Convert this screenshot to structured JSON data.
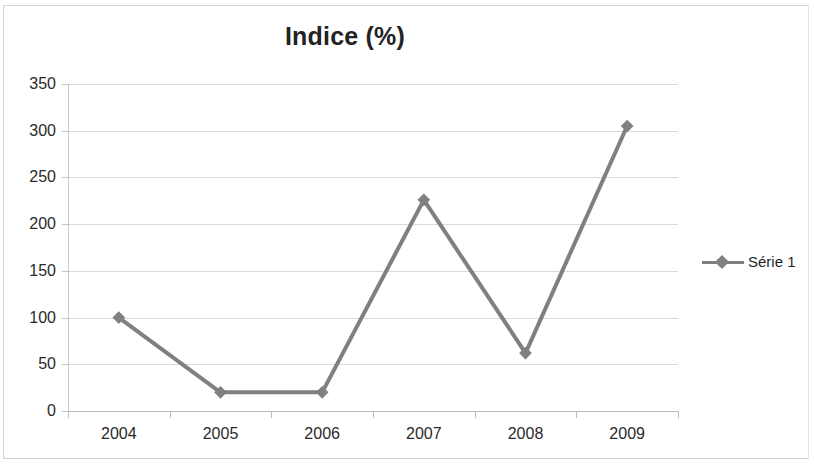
{
  "chart_data": {
    "type": "line",
    "title": "Indice (%)",
    "xlabel": "",
    "ylabel": "",
    "categories": [
      "2004",
      "2005",
      "2006",
      "2007",
      "2008",
      "2009"
    ],
    "series": [
      {
        "name": "Série 1",
        "values": [
          100,
          20,
          20,
          226,
          62,
          305
        ],
        "color": "#808080",
        "marker": "diamond"
      }
    ],
    "ylim": [
      0,
      350
    ],
    "ytick_step": 50,
    "yticks": [
      "0",
      "50",
      "100",
      "150",
      "200",
      "250",
      "300",
      "350"
    ],
    "grid": true,
    "legend_position": "right"
  },
  "legend": {
    "entries": [
      {
        "label": "Série 1",
        "marker_icon": "diamond-marker-icon"
      }
    ]
  },
  "colors": {
    "series": "#808080",
    "gridline": "#d9d9d9",
    "axis": "#bdbdbd",
    "text": "#2a2a2a",
    "title": "#232323",
    "frame": "#d5d5d5"
  }
}
